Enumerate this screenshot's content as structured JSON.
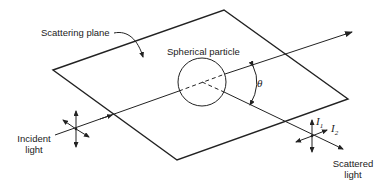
{
  "diagram": {
    "type": "light-scattering-geometry",
    "labels": {
      "scattering_plane": "Scattering plane",
      "spherical_particle": "Spherical particle",
      "incident_light_line1": "Incident",
      "incident_light_line2": "light",
      "scattered_light_line1": "Scattered",
      "scattered_light_line2": "light",
      "theta": "θ",
      "i1_symbol": "I",
      "i1_sub": "1",
      "i2_symbol": "I",
      "i2_sub": "2"
    },
    "colors": {
      "stroke": "#222222",
      "background": "#ffffff"
    }
  }
}
